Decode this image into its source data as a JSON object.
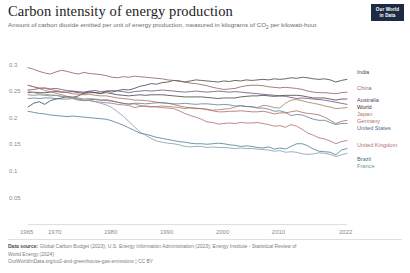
{
  "header": {
    "title": "Carbon intensity of energy production",
    "subtitle_part1": "Amount of carbon dioxide emitted per unit of energy production, measured in kilograms of CO",
    "subtitle_sub": "2",
    "subtitle_part2": " per kilowatt-hour.",
    "logo_line1": "Our World",
    "logo_line2": "in Data"
  },
  "footer": {
    "source_label": "Data source:",
    "source_text": " Global Carbon Budget (2023); U.S. Energy Information Administration (2023); Energy Institute - Statistical Review of",
    "source_text_line2": "World Energy (2024)",
    "license": "OurWorldInData.org/co2-and-greenhouse-gas-emissions | CC BY"
  },
  "chart_data": {
    "type": "line",
    "title": "Carbon intensity of energy production",
    "subtitle": "Amount of carbon dioxide emitted per unit of energy production, measured in kilograms of CO2 per kilowatt-hour.",
    "xlabel": "",
    "ylabel": "",
    "xlim": [
      1965,
      2022
    ],
    "ylim": [
      0.0,
      0.32
    ],
    "grid": false,
    "legend_position": "right",
    "x_ticks": [
      1965,
      1970,
      1980,
      1990,
      2000,
      2010,
      2022
    ],
    "y_ticks": [
      0.05,
      0.1,
      0.15,
      0.2,
      0.25,
      0.3
    ],
    "y_tick_labels": [
      "0.05",
      "0.1",
      "0.15",
      "0.2",
      "0.25",
      "0.3"
    ],
    "x": [
      1965,
      1966,
      1967,
      1968,
      1969,
      1970,
      1971,
      1972,
      1973,
      1974,
      1975,
      1976,
      1977,
      1978,
      1979,
      1980,
      1981,
      1982,
      1983,
      1984,
      1985,
      1986,
      1987,
      1988,
      1989,
      1990,
      1991,
      1992,
      1993,
      1994,
      1995,
      1996,
      1997,
      1998,
      1999,
      2000,
      2001,
      2002,
      2003,
      2004,
      2005,
      2006,
      2007,
      2008,
      2009,
      2010,
      2011,
      2012,
      2013,
      2014,
      2015,
      2016,
      2017,
      2018,
      2019,
      2020,
      2021,
      2022
    ],
    "series": [
      {
        "name": "India",
        "color": "#3f3f3f",
        "label_color": "#4a4a4a",
        "values": [
          0.221,
          0.228,
          0.231,
          0.226,
          0.233,
          0.236,
          0.238,
          0.241,
          0.239,
          0.242,
          0.247,
          0.25,
          0.248,
          0.246,
          0.251,
          0.249,
          0.252,
          0.254,
          0.253,
          0.256,
          0.26,
          0.262,
          0.265,
          0.264,
          0.267,
          0.268,
          0.271,
          0.27,
          0.268,
          0.27,
          0.272,
          0.271,
          0.27,
          0.269,
          0.268,
          0.27,
          0.269,
          0.271,
          0.27,
          0.272,
          0.271,
          0.272,
          0.273,
          0.272,
          0.274,
          0.273,
          0.274,
          0.276,
          0.275,
          0.277,
          0.276,
          0.274,
          0.273,
          0.274,
          0.272,
          0.268,
          0.271,
          0.273
        ]
      },
      {
        "name": "China",
        "color": "#8b5a5a",
        "label_color": "#9c6b6b",
        "values": [
          0.295,
          0.292,
          0.288,
          0.285,
          0.283,
          0.287,
          0.29,
          0.288,
          0.285,
          0.283,
          0.286,
          0.284,
          0.283,
          0.282,
          0.28,
          0.277,
          0.276,
          0.278,
          0.277,
          0.279,
          0.278,
          0.277,
          0.276,
          0.275,
          0.274,
          0.272,
          0.271,
          0.27,
          0.268,
          0.266,
          0.265,
          0.263,
          0.261,
          0.258,
          0.256,
          0.254,
          0.255,
          0.256,
          0.259,
          0.261,
          0.262,
          0.262,
          0.261,
          0.259,
          0.258,
          0.257,
          0.258,
          0.257,
          0.256,
          0.254,
          0.251,
          0.249,
          0.248,
          0.248,
          0.247,
          0.246,
          0.248,
          0.249
        ]
      },
      {
        "name": "Australia",
        "color": "#6b4a7a",
        "label_color": "#5b3f6b",
        "values": [
          0.253,
          0.254,
          0.256,
          0.257,
          0.255,
          0.256,
          0.254,
          0.252,
          0.251,
          0.25,
          0.249,
          0.251,
          0.252,
          0.25,
          0.251,
          0.252,
          0.251,
          0.25,
          0.248,
          0.25,
          0.251,
          0.252,
          0.251,
          0.252,
          0.253,
          0.252,
          0.251,
          0.25,
          0.249,
          0.25,
          0.251,
          0.25,
          0.249,
          0.25,
          0.251,
          0.25,
          0.249,
          0.25,
          0.249,
          0.248,
          0.247,
          0.246,
          0.245,
          0.244,
          0.243,
          0.242,
          0.241,
          0.239,
          0.237,
          0.238,
          0.237,
          0.236,
          0.235,
          0.234,
          0.232,
          0.23,
          0.228,
          0.226
        ]
      },
      {
        "name": "World",
        "color": "#3d3d3d",
        "label_color": "#2e2e2e",
        "values": [
          0.248,
          0.249,
          0.248,
          0.248,
          0.249,
          0.25,
          0.249,
          0.249,
          0.25,
          0.248,
          0.247,
          0.248,
          0.248,
          0.247,
          0.248,
          0.246,
          0.244,
          0.243,
          0.242,
          0.243,
          0.244,
          0.243,
          0.244,
          0.244,
          0.244,
          0.243,
          0.242,
          0.241,
          0.24,
          0.24,
          0.24,
          0.24,
          0.239,
          0.238,
          0.237,
          0.238,
          0.238,
          0.238,
          0.24,
          0.241,
          0.242,
          0.242,
          0.243,
          0.242,
          0.241,
          0.242,
          0.243,
          0.243,
          0.243,
          0.242,
          0.24,
          0.238,
          0.238,
          0.238,
          0.236,
          0.234,
          0.236,
          0.236
        ]
      },
      {
        "name": "Japan",
        "color": "#9c7a5a",
        "label_color": "#a08060",
        "values": [
          0.244,
          0.243,
          0.244,
          0.243,
          0.242,
          0.243,
          0.241,
          0.239,
          0.24,
          0.238,
          0.236,
          0.237,
          0.236,
          0.234,
          0.235,
          0.233,
          0.23,
          0.228,
          0.226,
          0.227,
          0.224,
          0.222,
          0.221,
          0.222,
          0.223,
          0.222,
          0.221,
          0.22,
          0.218,
          0.22,
          0.219,
          0.218,
          0.217,
          0.215,
          0.216,
          0.217,
          0.218,
          0.221,
          0.224,
          0.222,
          0.221,
          0.22,
          0.224,
          0.223,
          0.22,
          0.219,
          0.228,
          0.234,
          0.235,
          0.233,
          0.23,
          0.228,
          0.226,
          0.223,
          0.221,
          0.218,
          0.219,
          0.22
        ]
      },
      {
        "name": "Germany",
        "color": "#a8685a",
        "label_color": "#b0705f",
        "values": [
          0.262,
          0.259,
          0.257,
          0.256,
          0.254,
          0.252,
          0.25,
          0.248,
          0.246,
          0.245,
          0.244,
          0.245,
          0.243,
          0.242,
          0.242,
          0.24,
          0.238,
          0.237,
          0.236,
          0.234,
          0.234,
          0.233,
          0.232,
          0.23,
          0.229,
          0.228,
          0.226,
          0.223,
          0.221,
          0.219,
          0.218,
          0.218,
          0.216,
          0.214,
          0.212,
          0.212,
          0.213,
          0.213,
          0.214,
          0.213,
          0.212,
          0.212,
          0.213,
          0.211,
          0.208,
          0.21,
          0.21,
          0.212,
          0.214,
          0.211,
          0.209,
          0.208,
          0.206,
          0.202,
          0.196,
          0.19,
          0.194,
          0.196
        ]
      },
      {
        "name": "United States",
        "color": "#5a7a9c",
        "label_color": "#4a6a8c",
        "values": [
          0.237,
          0.238,
          0.237,
          0.238,
          0.238,
          0.237,
          0.236,
          0.236,
          0.237,
          0.234,
          0.233,
          0.235,
          0.235,
          0.234,
          0.233,
          0.232,
          0.23,
          0.228,
          0.227,
          0.228,
          0.228,
          0.227,
          0.228,
          0.229,
          0.229,
          0.228,
          0.227,
          0.227,
          0.228,
          0.227,
          0.226,
          0.227,
          0.227,
          0.226,
          0.225,
          0.226,
          0.225,
          0.223,
          0.223,
          0.222,
          0.222,
          0.219,
          0.219,
          0.217,
          0.213,
          0.214,
          0.211,
          0.205,
          0.207,
          0.206,
          0.202,
          0.198,
          0.196,
          0.196,
          0.192,
          0.188,
          0.19,
          0.19
        ]
      },
      {
        "name": "United Kingdom",
        "color": "#b06a6a",
        "label_color": "#b56f6f",
        "values": [
          0.262,
          0.259,
          0.256,
          0.252,
          0.25,
          0.247,
          0.244,
          0.241,
          0.238,
          0.236,
          0.234,
          0.233,
          0.231,
          0.23,
          0.229,
          0.228,
          0.226,
          0.225,
          0.224,
          0.22,
          0.222,
          0.223,
          0.222,
          0.221,
          0.22,
          0.219,
          0.218,
          0.214,
          0.209,
          0.205,
          0.202,
          0.198,
          0.193,
          0.192,
          0.189,
          0.19,
          0.191,
          0.19,
          0.192,
          0.191,
          0.191,
          0.192,
          0.19,
          0.188,
          0.185,
          0.186,
          0.183,
          0.188,
          0.185,
          0.179,
          0.172,
          0.168,
          0.163,
          0.161,
          0.157,
          0.152,
          0.156,
          0.158
        ]
      },
      {
        "name": "Brazil",
        "color": "#4a7a8c",
        "label_color": "#3f6f80",
        "values": [
          0.213,
          0.211,
          0.209,
          0.208,
          0.206,
          0.205,
          0.204,
          0.203,
          0.204,
          0.203,
          0.202,
          0.201,
          0.2,
          0.199,
          0.198,
          0.195,
          0.191,
          0.187,
          0.182,
          0.177,
          0.172,
          0.17,
          0.167,
          0.164,
          0.162,
          0.16,
          0.158,
          0.156,
          0.155,
          0.153,
          0.152,
          0.152,
          0.151,
          0.152,
          0.153,
          0.152,
          0.15,
          0.149,
          0.147,
          0.148,
          0.147,
          0.145,
          0.144,
          0.146,
          0.142,
          0.144,
          0.142,
          0.147,
          0.152,
          0.152,
          0.148,
          0.142,
          0.138,
          0.137,
          0.136,
          0.131,
          0.14,
          0.143
        ]
      },
      {
        "name": "France",
        "color": "#7a9ca8",
        "label_color": "#6f93a0",
        "values": [
          0.251,
          0.248,
          0.246,
          0.245,
          0.244,
          0.243,
          0.241,
          0.24,
          0.239,
          0.236,
          0.233,
          0.234,
          0.231,
          0.228,
          0.225,
          0.22,
          0.212,
          0.204,
          0.194,
          0.184,
          0.174,
          0.168,
          0.162,
          0.157,
          0.155,
          0.153,
          0.152,
          0.15,
          0.147,
          0.146,
          0.147,
          0.147,
          0.145,
          0.146,
          0.145,
          0.145,
          0.144,
          0.143,
          0.144,
          0.143,
          0.143,
          0.142,
          0.141,
          0.14,
          0.138,
          0.139,
          0.136,
          0.137,
          0.136,
          0.133,
          0.132,
          0.133,
          0.135,
          0.134,
          0.132,
          0.128,
          0.131,
          0.134
        ]
      }
    ],
    "legend": [
      {
        "name": "India",
        "y": 72
      },
      {
        "name": "China",
        "y": 88
      },
      {
        "name": "Australia",
        "y": 100
      },
      {
        "name": "World",
        "y": 107
      },
      {
        "name": "Japan",
        "y": 114
      },
      {
        "name": "Germany",
        "y": 121
      },
      {
        "name": "United States",
        "y": 128
      },
      {
        "name": "United Kingdom",
        "y": 145
      },
      {
        "name": "Brazil",
        "y": 159
      },
      {
        "name": "France",
        "y": 166
      }
    ]
  }
}
